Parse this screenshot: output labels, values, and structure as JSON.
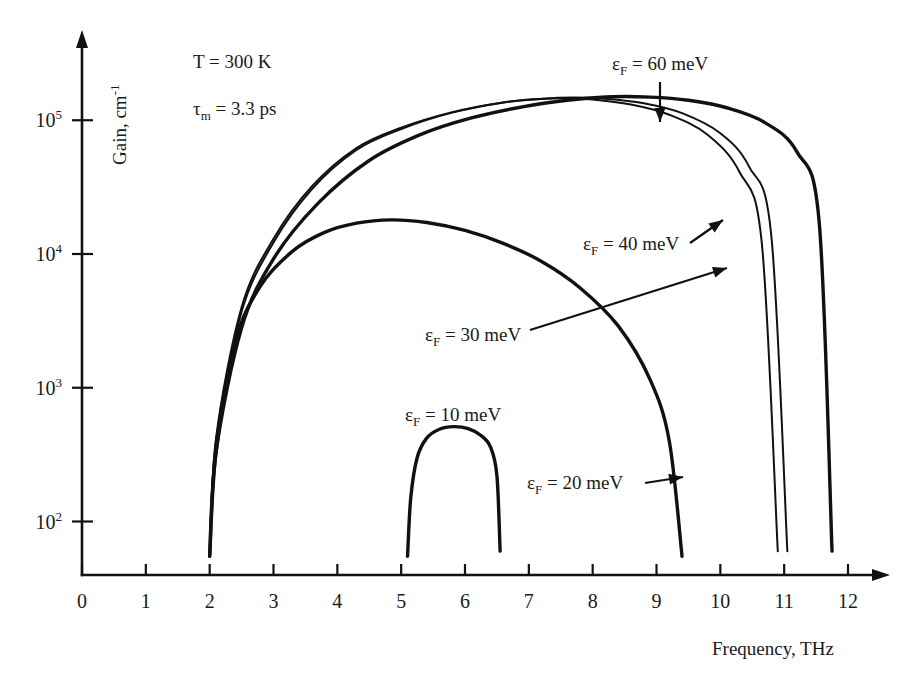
{
  "figure": {
    "background": "#ffffff",
    "ink_color": "#111111"
  },
  "chart_data": {
    "type": "line",
    "title": "",
    "xlabel": "Frequency, THz",
    "ylabel": "Gain, cm⁻¹",
    "xlim": [
      0,
      12
    ],
    "ylim_log10": [
      1.6,
      5.6
    ],
    "yscale": "log",
    "grid": false,
    "legend": "inline-annotations",
    "x_ticks": [
      0,
      1,
      2,
      3,
      4,
      5,
      6,
      7,
      8,
      9,
      10,
      11,
      12
    ],
    "x_tick_labels": [
      "0",
      "1",
      "2",
      "3",
      "4",
      "5",
      "6",
      "7",
      "8",
      "9",
      "10",
      "11",
      "12"
    ],
    "y_ticks_log10": [
      2,
      3,
      4,
      5
    ],
    "y_tick_labels": [
      "10²",
      "10³",
      "10⁴",
      "10⁵"
    ],
    "y_tick_mantissa": [
      "10",
      "10",
      "10",
      "10"
    ],
    "y_tick_exponent": [
      "2",
      "3",
      "4",
      "5"
    ],
    "annotations": [
      {
        "text": "T = 300 K",
        "x_px": 193,
        "y_px": 68
      },
      {
        "text": "τm = 3.3 ps",
        "x_px": 193,
        "y_px": 115
      }
    ],
    "params": {
      "temperature": "T = 300 K",
      "momentum_relaxation_time": "τm = 3.3 ps"
    },
    "series": [
      {
        "name": "εF = 10 meV",
        "label": "εF = 10 meV",
        "fermi_energy_meV": 10,
        "line_width": "thick",
        "x_start": 5.1,
        "x_end": 6.55,
        "x_peak": 5.82,
        "peak_gain": 510,
        "x": [
          5.1,
          5.15,
          5.25,
          5.4,
          5.6,
          5.82,
          6.05,
          6.25,
          6.4,
          6.5,
          6.55
        ],
        "y": [
          55,
          150,
          300,
          420,
          490,
          512,
          495,
          440,
          360,
          220,
          60
        ]
      },
      {
        "name": "εF = 20 meV",
        "label": "εF = 20 meV",
        "fermi_energy_meV": 20,
        "line_width": "thick",
        "x_start": 2.0,
        "x_end": 9.4,
        "x_peak": 4.85,
        "peak_gain": 18000,
        "x": [
          2.0,
          2.1,
          2.4,
          2.8,
          3.3,
          3.8,
          4.3,
          4.85,
          5.4,
          6.0,
          6.6,
          7.2,
          7.8,
          8.4,
          8.9,
          9.2,
          9.4
        ],
        "y": [
          55,
          330,
          2200,
          5800,
          10500,
          14500,
          17000,
          18000,
          17200,
          15000,
          12000,
          8800,
          5600,
          2900,
          1150,
          400,
          55
        ]
      },
      {
        "name": "εF = 30 meV",
        "label": "εF = 30 meV",
        "fermi_energy_meV": 30,
        "line_width": "thin",
        "x_start": 2.0,
        "x_end": 10.9,
        "x_peak": 7.55,
        "peak_gain": 146000,
        "x": [
          2.0,
          2.1,
          2.5,
          3.0,
          3.6,
          4.3,
          5.0,
          5.8,
          6.6,
          7.2,
          7.55,
          8.0,
          8.6,
          9.2,
          9.8,
          10.3,
          10.65,
          10.9
        ],
        "y": [
          55,
          420,
          4000,
          13000,
          32000,
          62000,
          88000,
          115000,
          136000,
          144000,
          146000,
          143000,
          131000,
          110000,
          78000,
          41000,
          12000,
          60
        ]
      },
      {
        "name": "εF = 40 meV",
        "label": "εF = 40 meV",
        "fermi_energy_meV": 40,
        "line_width": "thin",
        "x_start": 2.0,
        "x_end": 11.05,
        "x_peak": 7.7,
        "peak_gain": 148000,
        "x": [
          2.0,
          2.1,
          2.5,
          3.0,
          3.6,
          4.3,
          5.0,
          5.8,
          6.6,
          7.2,
          7.7,
          8.2,
          8.8,
          9.4,
          10.0,
          10.45,
          10.8,
          11.05
        ],
        "y": [
          55,
          400,
          3700,
          12200,
          30500,
          60000,
          86000,
          114000,
          136000,
          145000,
          148000,
          145000,
          134000,
          113000,
          80000,
          45000,
          13500,
          60
        ]
      },
      {
        "name": "εF = 60 meV",
        "label": "εF = 60 meV",
        "fermi_energy_meV": 60,
        "line_width": "thick",
        "x_start": 2.0,
        "x_end": 11.75,
        "x_peak": 8.3,
        "peak_gain": 150000,
        "x": [
          2.0,
          2.1,
          2.5,
          3.0,
          3.7,
          4.5,
          5.3,
          6.1,
          6.9,
          7.6,
          8.3,
          8.9,
          9.5,
          10.1,
          10.7,
          11.2,
          11.55,
          11.75
        ],
        "y": [
          55,
          330,
          2800,
          9200,
          24000,
          50000,
          78000,
          104000,
          126000,
          141000,
          150000,
          149000,
          141000,
          124000,
          96000,
          58000,
          17000,
          60
        ]
      }
    ],
    "series_labels": [
      {
        "id": "ef60",
        "text": "εF = 60 meV",
        "label_x_px": 612,
        "label_y_px": 70,
        "arrow": {
          "x1": 660,
          "y1": 82,
          "x2": 660,
          "y2": 122,
          "style": "down"
        }
      },
      {
        "id": "ef40",
        "text": "εF = 40 meV",
        "label_x_px": 583,
        "label_y_px": 250,
        "arrow": {
          "x1": 690,
          "y1": 243,
          "x2": 723,
          "y2": 220,
          "style": "up-right-short"
        }
      },
      {
        "id": "ef30",
        "text": "εF = 30 meV",
        "label_x_px": 425,
        "label_y_px": 341,
        "arrow": {
          "x1": 530,
          "y1": 330,
          "x2": 727,
          "y2": 268,
          "style": "up-right-long"
        }
      },
      {
        "id": "ef10",
        "text": "εF = 10 meV",
        "label_x_px": 405,
        "label_y_px": 421,
        "arrow": null
      },
      {
        "id": "ef20",
        "text": "εF = 20 meV",
        "label_x_px": 527,
        "label_y_px": 489,
        "arrow": {
          "x1": 645,
          "y1": 483,
          "x2": 683,
          "y2": 477,
          "style": "right"
        }
      }
    ]
  },
  "axis": {
    "x_title": "Frequency, THz",
    "y_title": "Gain, cm",
    "y_title_exponent": "-1",
    "x_title_x_px": 712,
    "x_title_y_px": 655
  }
}
